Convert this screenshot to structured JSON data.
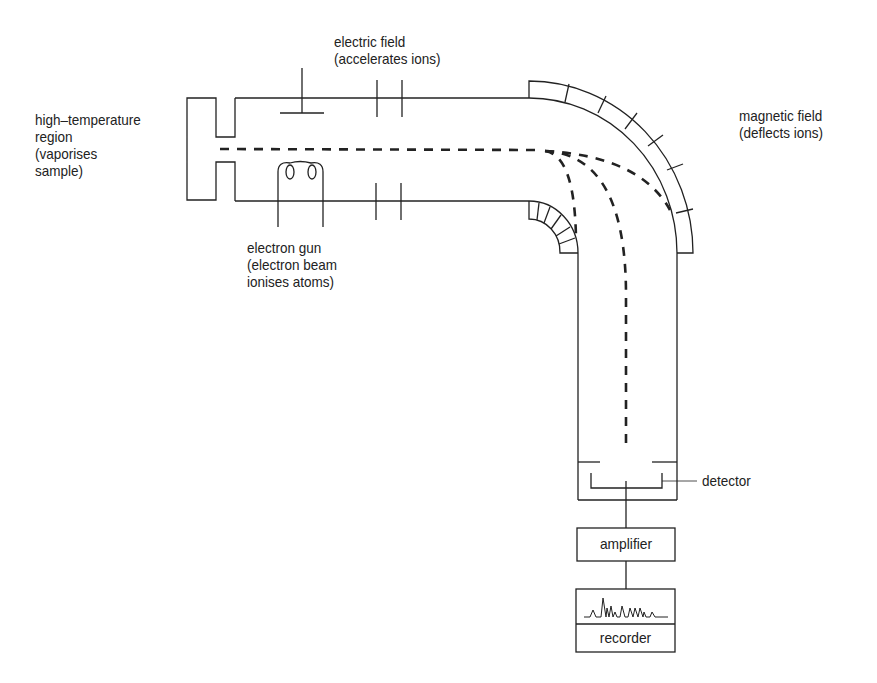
{
  "diagram": {
    "labels": {
      "high_temp": "high–temperature\nregion\n(vaporises\nsample)",
      "electric_field": "electric field\n(accelerates ions)",
      "magnetic_field": "magnetic field\n(deflects ions)",
      "electron_gun": "electron gun\n(electron beam\nionises atoms)",
      "detector": "detector",
      "amplifier": "amplifier",
      "recorder": "recorder"
    },
    "colors": {
      "line": "#222222",
      "background": "#ffffff"
    }
  }
}
